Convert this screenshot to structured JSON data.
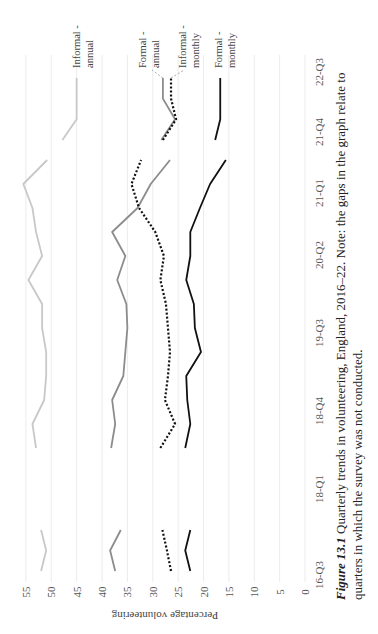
{
  "figure": {
    "caption_label": "Figure 13.1",
    "caption_line1": " Quarterly trends in volunteering, England, 2016–22. Note: the gaps in the graph relate to",
    "caption_line2": "quarters in which the survey was not conducted.",
    "orientation": "rotated-90-ccw"
  },
  "chart_data": {
    "type": "line",
    "title": "Quarterly trends in volunteering, England, 2016–22",
    "xlabel": "",
    "ylabel": "Percentage volunteering",
    "ylim": [
      0,
      55
    ],
    "yticks": [
      0,
      5,
      10,
      15,
      20,
      25,
      30,
      35,
      40,
      45,
      50,
      55
    ],
    "grid": true,
    "legend_position": "inline-end-labels",
    "x": [
      "16-Q3",
      "16-Q4",
      "17-Q1",
      "17-Q2",
      "17-Q3",
      "17-Q4",
      "18-Q1",
      "18-Q2",
      "18-Q3",
      "18-Q4",
      "19-Q1",
      "19-Q2",
      "19-Q3",
      "19-Q4",
      "20-Q1",
      "20-Q2",
      "20-Q3",
      "20-Q4",
      "21-Q1",
      "21-Q2",
      "21-Q3",
      "21-Q4",
      "22-Q1",
      "22-Q2",
      "22-Q3"
    ],
    "xtick_labels": [
      "16-Q3",
      "18-Q1",
      "18-Q4",
      "19-Q3",
      "20-Q2",
      "21-Q1",
      "21-Q4",
      "22-Q3"
    ],
    "series": [
      {
        "name": "Informal - annual",
        "style": "solid",
        "color": "#c8c8c8",
        "values": [
          52,
          51,
          52,
          null,
          null,
          null,
          53,
          53.7,
          51.4,
          51,
          51,
          51.8,
          51.8,
          54.5,
          51.8,
          53,
          53.7,
          55.5,
          50.8,
          null,
          null,
          47.8,
          45,
          45,
          45
        ]
      },
      {
        "name": "Formal - annual",
        "style": "solid",
        "color": "#8c8c8c",
        "values": [
          37.4,
          38.4,
          36.3,
          null,
          null,
          null,
          38.2,
          37.4,
          38,
          35.8,
          35.4,
          35,
          35.2,
          37,
          35.4,
          38,
          33,
          30.4,
          26.6,
          null,
          null,
          28.3,
          25.6,
          28,
          28
        ]
      },
      {
        "name": "Informal - monthly",
        "style": "dotted",
        "color": "#111111",
        "values": [
          26.4,
          27.2,
          28.1,
          null,
          null,
          null,
          28.5,
          25.6,
          27.6,
          27,
          26.6,
          27,
          27.4,
          28.5,
          27.8,
          29.5,
          32.7,
          34.2,
          32.3,
          null,
          null,
          28,
          25.4,
          26.4,
          26.4
        ]
      },
      {
        "name": "Formal - monthly",
        "style": "solid",
        "color": "#111111",
        "values": [
          22.6,
          23.6,
          22.6,
          null,
          null,
          null,
          23.6,
          22.6,
          23.2,
          23.4,
          20.5,
          21.7,
          21.9,
          23.4,
          22.6,
          22.6,
          20.7,
          18.7,
          15.6,
          null,
          null,
          17.7,
          16.7,
          16.7,
          16.7
        ]
      }
    ]
  },
  "legend": {
    "informal_annual": [
      "Informal -",
      "annual"
    ],
    "formal_annual": [
      "Formal -",
      "annual"
    ],
    "informal_monthly": [
      "Informal -",
      "monthly"
    ],
    "formal_monthly": [
      "Formal -",
      "monthly"
    ]
  }
}
